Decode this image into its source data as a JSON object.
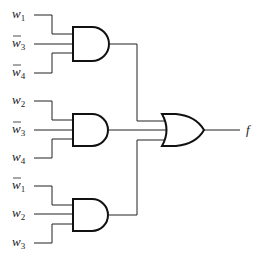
{
  "diagram": {
    "type": "logic-circuit",
    "output_label": "f",
    "expression": "f = w1·w̄3·w̄4 + w2·w̄3·w4 + w̄1·w2·w3",
    "and_gates": [
      {
        "inputs": [
          {
            "var": "w",
            "sub": "1",
            "negated": false
          },
          {
            "var": "w",
            "sub": "3",
            "negated": true
          },
          {
            "var": "w",
            "sub": "4",
            "negated": true
          }
        ]
      },
      {
        "inputs": [
          {
            "var": "w",
            "sub": "2",
            "negated": false
          },
          {
            "var": "w",
            "sub": "3",
            "negated": true
          },
          {
            "var": "w",
            "sub": "4",
            "negated": false
          }
        ]
      },
      {
        "inputs": [
          {
            "var": "w",
            "sub": "1",
            "negated": true
          },
          {
            "var": "w",
            "sub": "2",
            "negated": false
          },
          {
            "var": "w",
            "sub": "3",
            "negated": false
          }
        ]
      }
    ],
    "or_gate": {
      "inputs": 3
    },
    "colors": {
      "line": "#222222",
      "background": "#ffffff"
    }
  },
  "labels": {
    "g1_in1_var": "w",
    "g1_in1_sub": "1",
    "g1_in2_var": "w",
    "g1_in2_sub": "3",
    "g1_in3_var": "w",
    "g1_in3_sub": "4",
    "g2_in1_var": "w",
    "g2_in1_sub": "2",
    "g2_in2_var": "w",
    "g2_in2_sub": "3",
    "g2_in3_var": "w",
    "g2_in3_sub": "4",
    "g3_in1_var": "w",
    "g3_in1_sub": "1",
    "g3_in2_var": "w",
    "g3_in2_sub": "2",
    "g3_in3_var": "w",
    "g3_in3_sub": "3",
    "output": "f"
  }
}
